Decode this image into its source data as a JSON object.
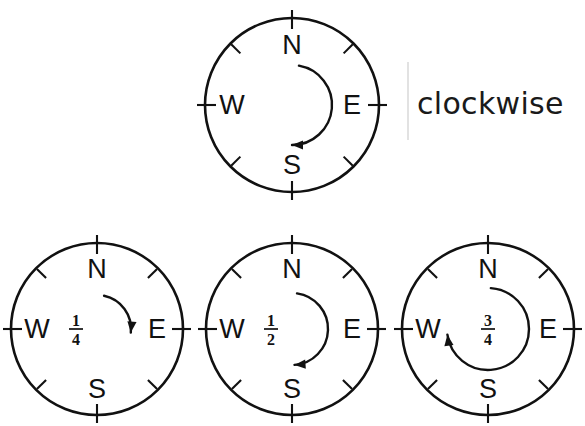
{
  "canvas": {
    "width": 585,
    "height": 426,
    "background": "#ffffff",
    "ink": "#111111",
    "rule_color": "#e2e2e2"
  },
  "caption": {
    "text": "clockwise",
    "rule_label": "vertical-divider"
  },
  "cardinals": {
    "north": "N",
    "east": "E",
    "south": "S",
    "west": "W"
  },
  "diagrams": [
    {
      "id": "full-turn-reference",
      "name": "compass-rose-reference",
      "cx": 292,
      "cy": 105,
      "r": 87,
      "label_offset": 27,
      "fraction": null,
      "turn": {
        "name": "half-turn-arrow",
        "start_deg": -80,
        "sweep_deg": 170,
        "radius": 40,
        "direction": "clockwise"
      }
    },
    {
      "id": "quarter-turn",
      "name": "compass-rose-quarter",
      "cx": 97,
      "cy": 329,
      "r": 86,
      "label_offset": 26,
      "fraction": {
        "numerator": "1",
        "denominator": "4",
        "x": 76,
        "y": 329
      },
      "turn": {
        "name": "quarter-turn-arrow",
        "start_deg": -78,
        "sweep_deg": 84,
        "radius": 34,
        "direction": "clockwise"
      }
    },
    {
      "id": "half-turn",
      "name": "compass-rose-half",
      "cx": 292,
      "cy": 329,
      "r": 86,
      "label_offset": 26,
      "fraction": {
        "numerator": "1",
        "denominator": "2",
        "x": 271,
        "y": 329
      },
      "turn": {
        "name": "half-turn-arrow",
        "start_deg": -82,
        "sweep_deg": 168,
        "radius": 36,
        "direction": "clockwise"
      }
    },
    {
      "id": "three-quarter-turn",
      "name": "compass-rose-three-quarter",
      "cx": 488,
      "cy": 329,
      "r": 86,
      "label_offset": 26,
      "fraction": {
        "numerator": "3",
        "denominator": "4",
        "x": 488,
        "y": 329
      },
      "turn": {
        "name": "three-quarter-turn-arrow",
        "start_deg": -86,
        "sweep_deg": 258,
        "radius": 41,
        "direction": "clockwise"
      }
    }
  ]
}
